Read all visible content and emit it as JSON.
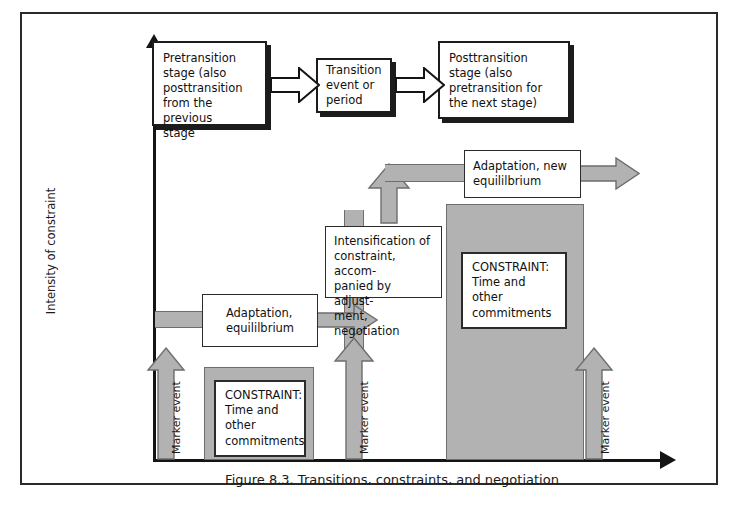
{
  "figure": {
    "caption": "Figure 8.3. Transitions, constraints, and negotiation",
    "y_axis_label": "Intensity of constraint",
    "colors": {
      "grey_fill": "#b2b2b2",
      "grey_stroke": "#6e6e6e",
      "ink": "#1c1c1c",
      "frame": "#2a2a2a",
      "paper": "#ffffff"
    }
  },
  "top_row": {
    "pretransition_box": "Pretransition\nstage (also\nposttransition\nfrom the previous\nstage",
    "transition_box": "Transition\nevent or\nperiod",
    "posttransition_box": "Posttransition\nstage (also\npretransition for\nthe next stage)"
  },
  "flow": {
    "adaptation_new_equilibrium": "Adaptation, new\nequililbrium",
    "intensification": "Intensification of\nconstraint, accom-\npanied by adjust-\nment, negotiation",
    "adaptation_equilibrium": "Adaptation,\nequililbrium"
  },
  "constraints": [
    {
      "label": "CONSTRAINT:\nTime and other\ncommitments"
    },
    {
      "label": "CONSTRAINT:\nTime and other\ncommitments"
    }
  ],
  "marker_events": [
    {
      "label": "Marker event"
    },
    {
      "label": "Marker event"
    },
    {
      "label": "Marker event"
    }
  ]
}
